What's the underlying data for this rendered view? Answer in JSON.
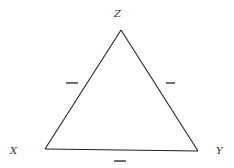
{
  "diagram": {
    "type": "signed-triangle",
    "colors": {
      "line": "#222222",
      "label": "#333333",
      "background": "#ffffff"
    },
    "vertices": [
      {
        "id": "Z",
        "label": "Z",
        "x": 121,
        "y": 30,
        "label_x": 114,
        "label_y": 17
      },
      {
        "id": "X",
        "label": "X",
        "x": 45,
        "y": 149,
        "label_x": 10,
        "label_y": 154
      },
      {
        "id": "Y",
        "label": "Y",
        "x": 198,
        "y": 151,
        "label_x": 216,
        "label_y": 154
      }
    ],
    "edges": [
      {
        "from": "X",
        "to": "Z",
        "sign": "−",
        "sign_x1": 66,
        "sign_y1": 83,
        "sign_x2": 78,
        "sign_y2": 83
      },
      {
        "from": "Z",
        "to": "Y",
        "sign": "−",
        "sign_x1": 166,
        "sign_y1": 83,
        "sign_x2": 175,
        "sign_y2": 83
      },
      {
        "from": "X",
        "to": "Y",
        "sign": "−",
        "sign_x1": 114,
        "sign_y1": 161,
        "sign_x2": 126,
        "sign_y2": 161
      }
    ]
  }
}
